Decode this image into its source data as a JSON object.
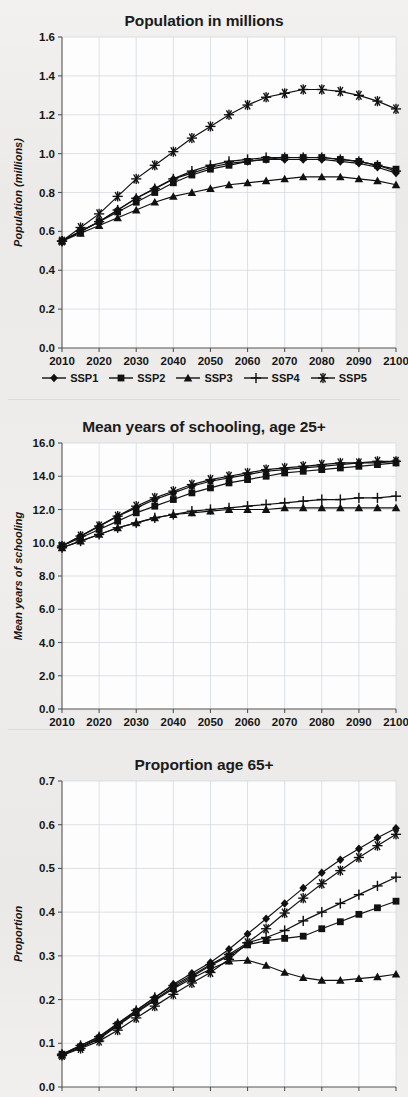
{
  "figure": {
    "background_color": "#ededeb",
    "series_color": "#111111",
    "grid_color": "#cfd6de",
    "axis_color": "#555555"
  },
  "legend": {
    "position": "below-first-chart",
    "entries": [
      {
        "label": "SSP1",
        "marker": "diamond"
      },
      {
        "label": "SSP2",
        "marker": "square"
      },
      {
        "label": "SSP3",
        "marker": "triangle"
      },
      {
        "label": "SSP4",
        "marker": "plus"
      },
      {
        "label": "SSP5",
        "marker": "asterisk"
      }
    ]
  },
  "chart_data": [
    {
      "id": "population",
      "type": "line",
      "title": "Population in millions",
      "xlabel": "",
      "ylabel": "Population (millions)",
      "x": [
        2010,
        2015,
        2020,
        2025,
        2030,
        2035,
        2040,
        2045,
        2050,
        2055,
        2060,
        2065,
        2070,
        2075,
        2080,
        2085,
        2090,
        2095,
        2100
      ],
      "tick_labels_x": [
        "2010",
        "2020",
        "2030",
        "2040",
        "2050",
        "2060",
        "2070",
        "2080",
        "2090",
        "2100"
      ],
      "tick_values_x": [
        2010,
        2020,
        2030,
        2040,
        2050,
        2060,
        2070,
        2080,
        2090,
        2100
      ],
      "tick_labels_y": [
        "0.0",
        "0.2",
        "0.4",
        "0.6",
        "0.8",
        "1.0",
        "1.2",
        "1.4",
        "1.6"
      ],
      "tick_values_y": [
        0.0,
        0.2,
        0.4,
        0.6,
        0.8,
        1.0,
        1.2,
        1.4,
        1.6
      ],
      "xlim": [
        2010,
        2100
      ],
      "ylim": [
        0.0,
        1.6
      ],
      "grid": true,
      "series": [
        {
          "name": "SSP1",
          "marker": "diamond",
          "values": [
            0.55,
            0.6,
            0.65,
            0.71,
            0.77,
            0.82,
            0.87,
            0.9,
            0.93,
            0.95,
            0.96,
            0.97,
            0.97,
            0.97,
            0.97,
            0.96,
            0.95,
            0.93,
            0.9
          ]
        },
        {
          "name": "SSP2",
          "marker": "square",
          "values": [
            0.55,
            0.6,
            0.65,
            0.7,
            0.75,
            0.8,
            0.85,
            0.89,
            0.92,
            0.94,
            0.96,
            0.97,
            0.98,
            0.98,
            0.98,
            0.97,
            0.96,
            0.94,
            0.92
          ]
        },
        {
          "name": "SSP3",
          "marker": "triangle",
          "values": [
            0.55,
            0.59,
            0.63,
            0.67,
            0.71,
            0.75,
            0.78,
            0.8,
            0.82,
            0.84,
            0.85,
            0.86,
            0.87,
            0.88,
            0.88,
            0.88,
            0.87,
            0.86,
            0.84
          ]
        },
        {
          "name": "SSP4",
          "marker": "plus",
          "values": [
            0.55,
            0.6,
            0.65,
            0.71,
            0.77,
            0.82,
            0.87,
            0.91,
            0.94,
            0.96,
            0.97,
            0.98,
            0.98,
            0.98,
            0.98,
            0.97,
            0.96,
            0.94,
            0.91
          ]
        },
        {
          "name": "SSP5",
          "marker": "asterisk",
          "values": [
            0.55,
            0.62,
            0.69,
            0.78,
            0.87,
            0.94,
            1.01,
            1.08,
            1.14,
            1.2,
            1.25,
            1.29,
            1.31,
            1.33,
            1.33,
            1.32,
            1.3,
            1.27,
            1.23
          ]
        }
      ]
    },
    {
      "id": "schooling",
      "type": "line",
      "title": "Mean years of schooling, age 25+",
      "xlabel": "",
      "ylabel": "Mean years of schooling",
      "x": [
        2010,
        2015,
        2020,
        2025,
        2030,
        2035,
        2040,
        2045,
        2050,
        2055,
        2060,
        2065,
        2070,
        2075,
        2080,
        2085,
        2090,
        2095,
        2100
      ],
      "tick_labels_x": [
        "2010",
        "2020",
        "2030",
        "2040",
        "2050",
        "2060",
        "2070",
        "2080",
        "2090",
        "2100"
      ],
      "tick_values_x": [
        2010,
        2020,
        2030,
        2040,
        2050,
        2060,
        2070,
        2080,
        2090,
        2100
      ],
      "tick_labels_y": [
        "0.0",
        "2.0",
        "4.0",
        "6.0",
        "8.0",
        "10.0",
        "12.0",
        "14.0",
        "16.0"
      ],
      "tick_values_y": [
        0.0,
        2.0,
        4.0,
        6.0,
        8.0,
        10.0,
        12.0,
        14.0,
        16.0
      ],
      "xlim": [
        2010,
        2100
      ],
      "ylim": [
        0.0,
        16.0
      ],
      "grid": true,
      "series": [
        {
          "name": "SSP1",
          "marker": "diamond",
          "values": [
            9.8,
            10.4,
            11.0,
            11.6,
            12.1,
            12.6,
            13.0,
            13.4,
            13.7,
            13.9,
            14.1,
            14.3,
            14.4,
            14.5,
            14.6,
            14.7,
            14.8,
            14.8,
            14.9
          ]
        },
        {
          "name": "SSP2",
          "marker": "square",
          "values": [
            9.8,
            10.3,
            10.8,
            11.3,
            11.8,
            12.2,
            12.6,
            13.0,
            13.3,
            13.6,
            13.8,
            14.0,
            14.2,
            14.3,
            14.4,
            14.5,
            14.6,
            14.7,
            14.8
          ]
        },
        {
          "name": "SSP3",
          "marker": "triangle",
          "values": [
            9.7,
            10.1,
            10.5,
            10.9,
            11.2,
            11.5,
            11.7,
            11.8,
            11.9,
            12.0,
            12.0,
            12.0,
            12.1,
            12.1,
            12.1,
            12.1,
            12.1,
            12.1,
            12.1
          ]
        },
        {
          "name": "SSP4",
          "marker": "plus",
          "values": [
            9.7,
            10.1,
            10.5,
            10.9,
            11.2,
            11.5,
            11.7,
            11.9,
            12.0,
            12.1,
            12.2,
            12.3,
            12.4,
            12.5,
            12.6,
            12.6,
            12.7,
            12.7,
            12.8
          ]
        },
        {
          "name": "SSP5",
          "marker": "asterisk",
          "values": [
            9.8,
            10.4,
            11.0,
            11.6,
            12.2,
            12.7,
            13.1,
            13.5,
            13.8,
            14.0,
            14.2,
            14.4,
            14.5,
            14.6,
            14.7,
            14.8,
            14.8,
            14.9,
            14.9
          ]
        }
      ]
    },
    {
      "id": "proportion-65plus",
      "type": "line",
      "title": "Proportion age 65+",
      "xlabel": "",
      "ylabel": "Proportion",
      "x": [
        2010,
        2015,
        2020,
        2025,
        2030,
        2035,
        2040,
        2045,
        2050,
        2055,
        2060,
        2065,
        2070,
        2075,
        2080,
        2085,
        2090,
        2095,
        2100
      ],
      "tick_labels_x": [],
      "tick_values_x": [
        2010,
        2020,
        2030,
        2040,
        2050,
        2060,
        2070,
        2080,
        2090,
        2100
      ],
      "tick_labels_y": [
        "0.0",
        "0.1",
        "0.2",
        "0.3",
        "0.4",
        "0.5",
        "0.6",
        "0.7"
      ],
      "tick_values_y": [
        0.0,
        0.1,
        0.2,
        0.3,
        0.4,
        0.5,
        0.6,
        0.7
      ],
      "xlim": [
        2010,
        2100
      ],
      "ylim": [
        0.0,
        0.7
      ],
      "grid": true,
      "series": [
        {
          "name": "SSP1",
          "marker": "diamond",
          "values": [
            0.075,
            0.095,
            0.115,
            0.145,
            0.175,
            0.205,
            0.235,
            0.26,
            0.285,
            0.315,
            0.35,
            0.385,
            0.42,
            0.455,
            0.49,
            0.52,
            0.545,
            0.57,
            0.592
          ]
        },
        {
          "name": "SSP2",
          "marker": "square",
          "values": [
            0.075,
            0.092,
            0.112,
            0.142,
            0.172,
            0.2,
            0.228,
            0.252,
            0.278,
            0.3,
            0.325,
            0.335,
            0.34,
            0.345,
            0.362,
            0.378,
            0.395,
            0.41,
            0.425
          ]
        },
        {
          "name": "SSP3",
          "marker": "triangle",
          "values": [
            0.073,
            0.09,
            0.11,
            0.14,
            0.17,
            0.198,
            0.225,
            0.248,
            0.27,
            0.288,
            0.29,
            0.278,
            0.262,
            0.25,
            0.244,
            0.244,
            0.248,
            0.252,
            0.258
          ]
        },
        {
          "name": "SSP4",
          "marker": "plus",
          "values": [
            0.075,
            0.095,
            0.115,
            0.145,
            0.175,
            0.205,
            0.232,
            0.255,
            0.28,
            0.303,
            0.33,
            0.342,
            0.358,
            0.38,
            0.4,
            0.42,
            0.44,
            0.46,
            0.48
          ]
        },
        {
          "name": "SSP5",
          "marker": "asterisk",
          "values": [
            0.072,
            0.088,
            0.105,
            0.13,
            0.158,
            0.185,
            0.212,
            0.238,
            0.262,
            0.292,
            0.33,
            0.362,
            0.398,
            0.432,
            0.465,
            0.495,
            0.525,
            0.552,
            0.578
          ]
        }
      ]
    }
  ]
}
